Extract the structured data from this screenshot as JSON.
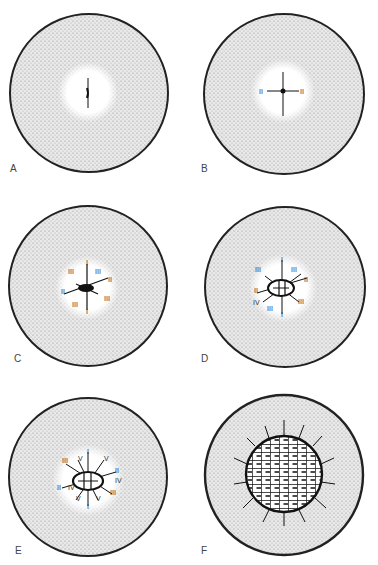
{
  "figure": {
    "panels": [
      {
        "id": "A",
        "labels": [
          {
            "text": "I",
            "x": 88,
            "y": 72
          },
          {
            "text": "I",
            "x": 88,
            "y": 112
          }
        ]
      },
      {
        "id": "B",
        "labels": [
          {
            "text": "I",
            "x": 95,
            "y": 70
          },
          {
            "text": "II",
            "x": 72,
            "y": 94
          },
          {
            "text": "II",
            "x": 113,
            "y": 94
          },
          {
            "text": "I",
            "x": 95,
            "y": 118
          }
        ]
      },
      {
        "id": "C",
        "labels": [
          {
            "text": "I",
            "x": 87,
            "y": 73
          },
          {
            "text": "III",
            "x": 69,
            "y": 82
          },
          {
            "text": "III",
            "x": 97,
            "y": 82
          },
          {
            "text": "II",
            "x": 110,
            "y": 91
          },
          {
            "text": "II",
            "x": 62,
            "y": 103
          },
          {
            "text": "III",
            "x": 73,
            "y": 116
          },
          {
            "text": "III",
            "x": 105,
            "y": 110
          },
          {
            "text": "I",
            "x": 87,
            "y": 122
          }
        ]
      },
      {
        "id": "D",
        "labels": [
          {
            "text": "I",
            "x": 93,
            "y": 69
          },
          {
            "text": "III",
            "x": 67,
            "y": 80
          },
          {
            "text": "III",
            "x": 103,
            "y": 80
          },
          {
            "text": "II",
            "x": 116,
            "y": 90
          },
          {
            "text": "II",
            "x": 66,
            "y": 101
          },
          {
            "text": "IV",
            "x": 66,
            "y": 113
          },
          {
            "text": "III",
            "x": 79,
            "y": 119
          },
          {
            "text": "III",
            "x": 110,
            "y": 112
          },
          {
            "text": "I",
            "x": 93,
            "y": 125
          }
        ]
      },
      {
        "id": "E",
        "labels": [
          {
            "text": "I",
            "x": 88,
            "y": 73
          },
          {
            "text": "V",
            "x": 79,
            "y": 79
          },
          {
            "text": "III",
            "x": 63,
            "y": 81
          },
          {
            "text": "V",
            "x": 106,
            "y": 79
          },
          {
            "text": "II",
            "x": 117,
            "y": 91
          },
          {
            "text": "IV",
            "x": 117,
            "y": 100
          },
          {
            "text": "II",
            "x": 58,
            "y": 108
          },
          {
            "text": "IV",
            "x": 70,
            "y": 108
          },
          {
            "text": "III",
            "x": 111,
            "y": 112
          },
          {
            "text": "V",
            "x": 77,
            "y": 119
          },
          {
            "text": "V",
            "x": 97,
            "y": 119
          },
          {
            "text": "I",
            "x": 88,
            "y": 127
          }
        ]
      },
      {
        "id": "F",
        "labels": []
      }
    ]
  }
}
